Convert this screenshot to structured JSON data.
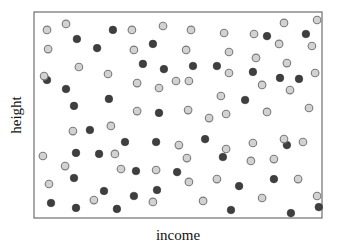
{
  "chart_data": {
    "type": "scatter",
    "title": "",
    "xlabel": "income",
    "ylabel": "height",
    "xlim": [
      0,
      100
    ],
    "ylim": [
      0,
      100
    ],
    "grid": false,
    "ticks": false,
    "legend": null,
    "series": [
      {
        "name": "dark",
        "color": "#3f3f3f",
        "points": [
          [
            27.4,
            91.3
          ],
          [
            14.9,
            86.9
          ],
          [
            21.9,
            82.5
          ],
          [
            41.3,
            84.5
          ],
          [
            80.9,
            88.3
          ],
          [
            94.4,
            89.3
          ],
          [
            37.8,
            74.8
          ],
          [
            45.1,
            72.3
          ],
          [
            55.2,
            73.8
          ],
          [
            63.5,
            73.8
          ],
          [
            76.0,
            70.9
          ],
          [
            85.4,
            68.0
          ],
          [
            92.0,
            67.5
          ],
          [
            4.5,
            67.0
          ],
          [
            11.1,
            62.6
          ],
          [
            26.0,
            57.8
          ],
          [
            13.9,
            54.4
          ],
          [
            73.3,
            57.3
          ],
          [
            43.4,
            51.0
          ],
          [
            19.4,
            42.7
          ],
          [
            31.6,
            36.9
          ],
          [
            42.4,
            36.9
          ],
          [
            59.4,
            38.3
          ],
          [
            87.8,
            35.4
          ],
          [
            14.6,
            31.6
          ],
          [
            22.6,
            31.1
          ],
          [
            65.6,
            29.6
          ],
          [
            35.4,
            22.8
          ],
          [
            49.7,
            22.3
          ],
          [
            13.9,
            19.4
          ],
          [
            71.2,
            15.5
          ],
          [
            83.3,
            18.9
          ],
          [
            24.3,
            13.1
          ],
          [
            42.7,
            13.6
          ],
          [
            34.7,
            10.7
          ],
          [
            5.9,
            7.3
          ],
          [
            14.6,
            4.9
          ],
          [
            28.8,
            4.4
          ],
          [
            68.4,
            3.9
          ],
          [
            89.2,
            2.4
          ],
          [
            98.9,
            5.3
          ]
        ]
      },
      {
        "name": "light",
        "color": "#d2d2d2",
        "points": [
          [
            4.5,
            91.3
          ],
          [
            11.1,
            94.2
          ],
          [
            34.0,
            91.3
          ],
          [
            44.8,
            93.2
          ],
          [
            54.5,
            91.3
          ],
          [
            66.0,
            89.8
          ],
          [
            76.4,
            89.3
          ],
          [
            86.8,
            94.7
          ],
          [
            98.3,
            96.1
          ],
          [
            4.9,
            82.0
          ],
          [
            34.7,
            81.6
          ],
          [
            52.8,
            81.6
          ],
          [
            67.7,
            80.6
          ],
          [
            85.1,
            84.5
          ],
          [
            96.5,
            83.5
          ],
          [
            15.6,
            73.3
          ],
          [
            25.7,
            69.9
          ],
          [
            77.1,
            77.7
          ],
          [
            87.8,
            75.2
          ],
          [
            67.7,
            70.4
          ],
          [
            97.6,
            70.4
          ],
          [
            35.8,
            65.5
          ],
          [
            43.4,
            63.1
          ],
          [
            49.3,
            66.5
          ],
          [
            53.8,
            66.5
          ],
          [
            79.2,
            64.6
          ],
          [
            88.9,
            62.1
          ],
          [
            64.9,
            59.2
          ],
          [
            35.8,
            51.9
          ],
          [
            53.5,
            52.4
          ],
          [
            60.8,
            48.5
          ],
          [
            66.7,
            50.5
          ],
          [
            80.9,
            51.5
          ],
          [
            95.5,
            53.4
          ],
          [
            3.5,
            68.9
          ],
          [
            13.5,
            42.2
          ],
          [
            26.7,
            44.7
          ],
          [
            50.3,
            35.4
          ],
          [
            66.7,
            33.5
          ],
          [
            76.0,
            36.4
          ],
          [
            86.8,
            38.3
          ],
          [
            93.4,
            36.9
          ],
          [
            3.1,
            30.1
          ],
          [
            28.1,
            31.1
          ],
          [
            53.1,
            29.1
          ],
          [
            75.3,
            27.7
          ],
          [
            83.3,
            28.6
          ],
          [
            10.8,
            25.2
          ],
          [
            30.2,
            23.8
          ],
          [
            42.4,
            23.3
          ],
          [
            5.2,
            16.5
          ],
          [
            53.8,
            17.5
          ],
          [
            63.5,
            18.9
          ],
          [
            91.7,
            18.9
          ],
          [
            20.8,
            8.7
          ],
          [
            41.3,
            7.8
          ],
          [
            58.7,
            8.3
          ],
          [
            79.2,
            9.7
          ],
          [
            98.3,
            10.7
          ]
        ]
      }
    ]
  },
  "layout": {
    "plot_box": {
      "x": 34,
      "y": 12,
      "width": 288,
      "height": 206
    },
    "dot_radius": 3.8
  }
}
